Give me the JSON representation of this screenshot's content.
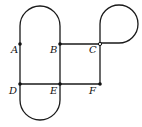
{
  "diagram": {
    "type": "graph",
    "vertices": [
      {
        "id": "A",
        "label": "A",
        "x": 20,
        "y": 44,
        "label_x": 11,
        "label_y": 53
      },
      {
        "id": "B",
        "label": "B",
        "x": 60,
        "y": 44,
        "label_x": 50,
        "label_y": 53
      },
      {
        "id": "C",
        "label": "C",
        "x": 100,
        "y": 44,
        "label_x": 89,
        "label_y": 53
      },
      {
        "id": "D",
        "label": "D",
        "x": 20,
        "y": 84,
        "label_x": 9,
        "label_y": 94
      },
      {
        "id": "E",
        "label": "E",
        "x": 60,
        "y": 84,
        "label_x": 50,
        "label_y": 94
      },
      {
        "id": "F",
        "label": "F",
        "x": 100,
        "y": 84,
        "label_x": 89,
        "label_y": 94
      }
    ],
    "edges": [
      {
        "from": "A",
        "to": "B",
        "kind": "arc-top"
      },
      {
        "from": "A",
        "to": "D",
        "kind": "straight"
      },
      {
        "from": "B",
        "to": "E",
        "kind": "straight"
      },
      {
        "from": "B",
        "to": "C",
        "kind": "straight"
      },
      {
        "from": "C",
        "to": "F",
        "kind": "straight"
      },
      {
        "from": "C",
        "to": "C",
        "kind": "loop"
      },
      {
        "from": "D",
        "to": "E",
        "kind": "straight"
      },
      {
        "from": "E",
        "to": "F",
        "kind": "straight"
      },
      {
        "from": "D",
        "to": "E",
        "kind": "arc-bottom"
      }
    ]
  }
}
